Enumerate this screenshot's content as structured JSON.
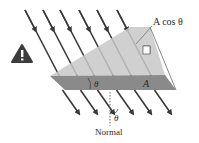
{
  "figure": {
    "labels": {
      "projected_area": "A cos θ",
      "area": "A",
      "angle_top": "θ",
      "angle_normal": "θ",
      "normal": "Normal"
    },
    "field_line_count": 6,
    "icons": {
      "warning": "warning-triangle-icon"
    },
    "colors": {
      "field_line": "#3a3a3a",
      "tilted_plane": "#c8c8c8",
      "flat_plane": "#8a8a8a",
      "warning_bg": "#3c3c3c",
      "warning_mark": "#ffffff",
      "normal_line": "#6a6a6a"
    }
  }
}
